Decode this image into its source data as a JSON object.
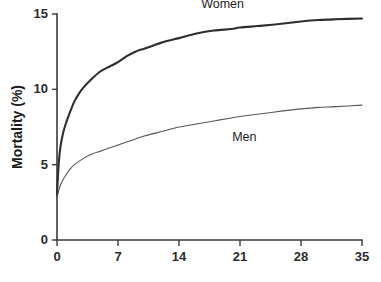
{
  "chart_data": {
    "type": "line",
    "title": "",
    "xlabel": "",
    "ylabel": "Mortality (%)",
    "xlim": [
      0,
      35
    ],
    "ylim": [
      0,
      15
    ],
    "grid": false,
    "legend_position": "inline-annotations",
    "x_ticks": [
      0,
      7,
      14,
      21,
      28,
      35
    ],
    "y_ticks": [
      0,
      5,
      10,
      15
    ],
    "x_tick_labels": [
      "0",
      "7",
      "14",
      "21",
      "28",
      "35"
    ],
    "y_tick_labels": [
      "0",
      "5",
      "10",
      "15"
    ],
    "series": [
      {
        "name": "Women",
        "label": "Women",
        "color": "#2e2e2e",
        "line_width": 2.1,
        "label_x": 19.0,
        "label_y": 15.4,
        "x": [
          0,
          0.2,
          0.4,
          0.7,
          1,
          1.5,
          2,
          2.5,
          3,
          4,
          5,
          6,
          7,
          8,
          9,
          10,
          11,
          12,
          14,
          16,
          18,
          20,
          21,
          23,
          25,
          28,
          30,
          32,
          35
        ],
        "values": [
          3.0,
          5.1,
          6.2,
          7.1,
          7.7,
          8.5,
          9.2,
          9.7,
          10.1,
          10.7,
          11.2,
          11.5,
          11.8,
          12.2,
          12.5,
          12.7,
          12.9,
          13.1,
          13.4,
          13.7,
          13.9,
          14.0,
          14.1,
          14.2,
          14.3,
          14.5,
          14.6,
          14.65,
          14.7
        ]
      },
      {
        "name": "Men",
        "label": "Men",
        "color": "#575757",
        "line_width": 1.1,
        "label_x": 21.5,
        "label_y": 6.6,
        "x": [
          0,
          0.3,
          0.6,
          1,
          1.5,
          2,
          3,
          4,
          5,
          6,
          7,
          8,
          9,
          10,
          12,
          14,
          16,
          18,
          20,
          21,
          23,
          25,
          28,
          30,
          32,
          35
        ],
        "values": [
          2.8,
          3.5,
          3.9,
          4.3,
          4.7,
          5.0,
          5.4,
          5.7,
          5.9,
          6.1,
          6.3,
          6.5,
          6.7,
          6.9,
          7.2,
          7.5,
          7.7,
          7.9,
          8.1,
          8.2,
          8.35,
          8.5,
          8.7,
          8.8,
          8.85,
          8.95
        ]
      }
    ]
  },
  "axes": {
    "y_axis_title": "Mortality (%)"
  }
}
